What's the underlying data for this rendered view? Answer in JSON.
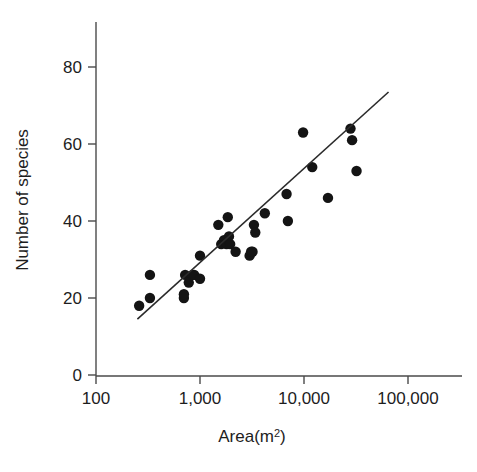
{
  "chart_data": {
    "type": "scatter",
    "title": "",
    "xlabel": "Area(m²)",
    "ylabel": "Number of species",
    "x_scale": "log",
    "y_scale": "linear",
    "xlim": [
      100,
      100000
    ],
    "ylim": [
      0,
      90
    ],
    "xticks": [
      100,
      1000,
      10000,
      100000
    ],
    "xtick_labels": [
      "100",
      "1,000",
      "10,000",
      "100,000"
    ],
    "yticks": [
      0,
      20,
      40,
      60,
      80
    ],
    "ytick_labels": [
      "0",
      "20",
      "40",
      "60",
      "80"
    ],
    "grid": false,
    "legend": null,
    "points": [
      {
        "x": 260,
        "y": 18
      },
      {
        "x": 330,
        "y": 20
      },
      {
        "x": 330,
        "y": 26
      },
      {
        "x": 700,
        "y": 20
      },
      {
        "x": 700,
        "y": 21
      },
      {
        "x": 720,
        "y": 26
      },
      {
        "x": 780,
        "y": 24
      },
      {
        "x": 850,
        "y": 26
      },
      {
        "x": 880,
        "y": 26
      },
      {
        "x": 1000,
        "y": 25
      },
      {
        "x": 1000,
        "y": 31
      },
      {
        "x": 1500,
        "y": 39
      },
      {
        "x": 1600,
        "y": 34
      },
      {
        "x": 1700,
        "y": 35
      },
      {
        "x": 1800,
        "y": 34
      },
      {
        "x": 1850,
        "y": 41
      },
      {
        "x": 1900,
        "y": 36
      },
      {
        "x": 1950,
        "y": 34
      },
      {
        "x": 2200,
        "y": 32
      },
      {
        "x": 3000,
        "y": 31
      },
      {
        "x": 3100,
        "y": 32
      },
      {
        "x": 3200,
        "y": 32
      },
      {
        "x": 3300,
        "y": 39
      },
      {
        "x": 3400,
        "y": 37
      },
      {
        "x": 4200,
        "y": 42
      },
      {
        "x": 6800,
        "y": 47
      },
      {
        "x": 7000,
        "y": 40
      },
      {
        "x": 9800,
        "y": 63
      },
      {
        "x": 12000,
        "y": 54
      },
      {
        "x": 17000,
        "y": 46
      },
      {
        "x": 28000,
        "y": 64
      },
      {
        "x": 29000,
        "y": 61
      },
      {
        "x": 32000,
        "y": 53
      }
    ],
    "fit_line": {
      "x_start": 250,
      "y_start": 14.5,
      "x_end": 65000,
      "y_end": 73.5
    }
  }
}
